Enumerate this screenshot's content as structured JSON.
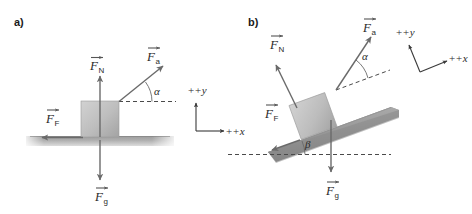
{
  "figure": {
    "title_a": "a)",
    "title_b": "b)"
  },
  "panel_a": {
    "label": "a)",
    "forces": [
      {
        "key": "normal",
        "symbol": "F",
        "subscript": "N",
        "name": "normal-force",
        "direction": "up"
      },
      {
        "key": "applied",
        "symbol": "F",
        "subscript": "a",
        "name": "applied-force",
        "direction": "up-right"
      },
      {
        "key": "friction",
        "symbol": "F",
        "subscript": "F",
        "name": "friction-force",
        "direction": "left"
      },
      {
        "key": "gravity",
        "symbol": "F",
        "subscript": "g",
        "name": "gravity-force",
        "direction": "down"
      }
    ],
    "angle": {
      "symbol": "α",
      "name": "alpha",
      "value_deg": 28,
      "measured_from": "horizontal"
    },
    "axes": {
      "y_label": "+y",
      "x_label": "+x",
      "rotation_deg": 0
    },
    "surface": {
      "name": "ground",
      "angle_deg": 0
    }
  },
  "panel_b": {
    "label": "b)",
    "forces": [
      {
        "key": "normal",
        "symbol": "F",
        "subscript": "N",
        "name": "normal-force",
        "direction": "perpendicular-to-incline"
      },
      {
        "key": "applied",
        "symbol": "F",
        "subscript": "a",
        "name": "applied-force",
        "direction": "up-right"
      },
      {
        "key": "friction",
        "symbol": "F",
        "subscript": "F",
        "name": "friction-force",
        "direction": "down-slope"
      },
      {
        "key": "gravity",
        "symbol": "F",
        "subscript": "g",
        "name": "gravity-force",
        "direction": "down"
      }
    ],
    "angles": [
      {
        "symbol": "α",
        "name": "alpha",
        "value_deg": 28,
        "measured_from": "incline-parallel"
      },
      {
        "symbol": "β",
        "name": "beta",
        "value_deg": 20,
        "measured_from": "horizontal"
      }
    ],
    "axes": {
      "y_label": "+y",
      "x_label": "+x",
      "rotation_deg": 20
    },
    "surface": {
      "name": "incline",
      "angle_deg": 20
    }
  },
  "colors": {
    "block_light": "#c9c9c9",
    "block_dark": "#a9a9a9",
    "ground_dark": "#8c8c8c",
    "ground_light": "#cfcfcf",
    "arrow": "#6a6a6a",
    "text": "#2b2b2b",
    "background": "#ffffff"
  }
}
